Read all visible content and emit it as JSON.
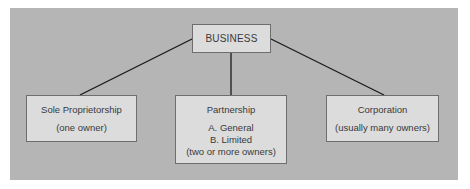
{
  "diagram": {
    "type": "hierarchy",
    "colors": {
      "background": "#b5b5b5",
      "box_fill": "#dcdcdc",
      "box_border": "#6e6e6e",
      "connector": "#1a1a1a",
      "text": "#3a3a3a"
    },
    "root": {
      "label": "BUSINESS"
    },
    "children": [
      {
        "title": "Sole Proprietorship",
        "lines": [
          "(one owner)"
        ]
      },
      {
        "title": "Partnership",
        "lines": [
          "A. General",
          "B. Limited",
          "(two or more owners)"
        ]
      },
      {
        "title": "Corporation",
        "lines": [
          "(usually many owners)"
        ]
      }
    ]
  }
}
